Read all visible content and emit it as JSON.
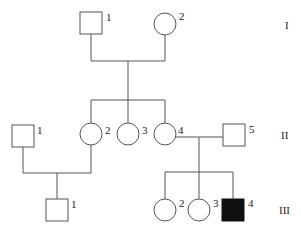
{
  "diagram": {
    "type": "pedigree",
    "generations": [
      {
        "label": "I",
        "members": [
          {
            "id": "I-1",
            "label": "1",
            "sex": "male",
            "affected": false
          },
          {
            "id": "I-2",
            "label": "2",
            "sex": "female",
            "affected": false
          }
        ]
      },
      {
        "label": "II",
        "members": [
          {
            "id": "II-1",
            "label": "1",
            "sex": "male",
            "affected": false
          },
          {
            "id": "II-2",
            "label": "2",
            "sex": "female",
            "affected": false
          },
          {
            "id": "II-3",
            "label": "3",
            "sex": "female",
            "affected": false
          },
          {
            "id": "II-4",
            "label": "4",
            "sex": "female",
            "affected": false
          },
          {
            "id": "II-5",
            "label": "5",
            "sex": "male",
            "affected": false
          }
        ]
      },
      {
        "label": "III",
        "members": [
          {
            "id": "III-1",
            "label": "1",
            "sex": "male",
            "affected": false
          },
          {
            "id": "III-2",
            "label": "2",
            "sex": "female",
            "affected": false
          },
          {
            "id": "III-3",
            "label": "3",
            "sex": "female",
            "affected": false
          },
          {
            "id": "III-4",
            "label": "4",
            "sex": "male",
            "affected": true
          }
        ]
      }
    ],
    "couples": [
      {
        "partners": [
          "I-1",
          "I-2"
        ],
        "children": [
          "II-2",
          "II-3",
          "II-4"
        ]
      },
      {
        "partners": [
          "II-1",
          "II-2"
        ],
        "children": [
          "III-1"
        ]
      },
      {
        "partners": [
          "II-4",
          "II-5"
        ],
        "children": [
          "III-2",
          "III-3",
          "III-4"
        ]
      }
    ],
    "colors": {
      "line": "#555555",
      "affected_fill": "#111111",
      "unaffected_fill": "#ffffff"
    }
  }
}
